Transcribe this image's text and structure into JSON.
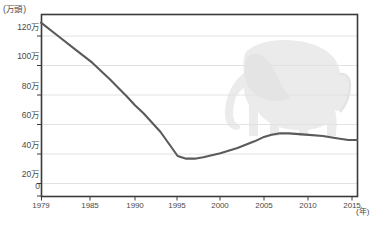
{
  "chart_data": {
    "type": "line",
    "title": "",
    "subtitle": "",
    "xlabel": "年",
    "ylabel": "万頭",
    "y_unit_label": "(万頭)",
    "x_unit_label": "(年)",
    "xlim": [
      1979,
      2016
    ],
    "ylim": [
      0,
      130
    ],
    "grid": true,
    "legend": false,
    "legend_position": "none",
    "line_color": "#5a5a5a",
    "watermark": "elephant-silhouette",
    "watermark_color": "#e9e9e9",
    "yticks": [
      0,
      20,
      40,
      60,
      80,
      100,
      120
    ],
    "ytick_labels": [
      "0",
      "20万",
      "40万",
      "60万",
      "80万",
      "100万",
      "120万"
    ],
    "xticks": [
      1979,
      1985,
      1990,
      1995,
      2000,
      2005,
      2010,
      2015
    ],
    "xtick_labels": [
      "1979",
      "1985",
      "1990",
      "1995",
      "2000",
      "2005",
      "2010",
      "2015"
    ],
    "series": [
      {
        "name": "アフリカゾウ生息数",
        "x": [
          1979,
          1981,
          1983,
          1985,
          1987,
          1989,
          1990,
          1991,
          1993,
          1995,
          1996,
          1997,
          1998,
          2000,
          2002,
          2004,
          2005,
          2006,
          2007,
          2008,
          2010,
          2012,
          2014,
          2015,
          2016
        ],
        "values": [
          130,
          120,
          110,
          100,
          88,
          75,
          68,
          62,
          48,
          30,
          28,
          28,
          29,
          32,
          36,
          41,
          44,
          46,
          47,
          47,
          46,
          45,
          43,
          42,
          42
        ]
      }
    ]
  }
}
